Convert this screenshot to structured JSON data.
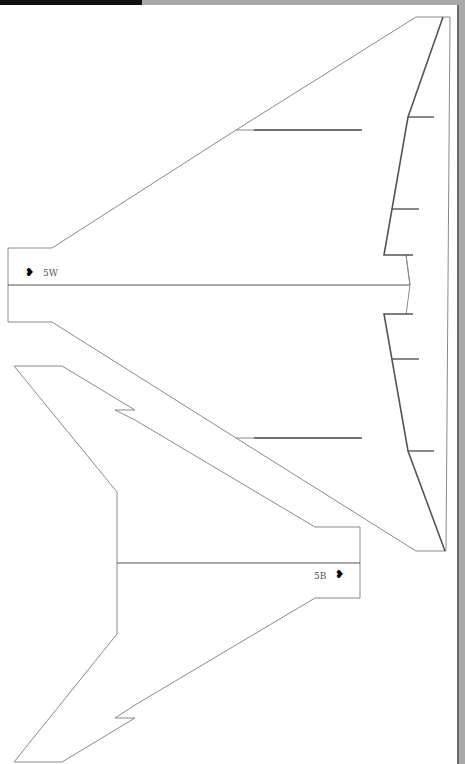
{
  "document": {
    "type": "paper airplane cut-out template",
    "stroke_color": "#888888",
    "fold_line_color": "#555555"
  },
  "parts": [
    {
      "id": "wing",
      "label": "5W",
      "marker": "bat-glyph",
      "orientation": "left"
    },
    {
      "id": "body",
      "label": "5B",
      "marker": "bat-glyph",
      "orientation": "right"
    }
  ],
  "labels": {
    "wing_code": "5W",
    "body_code": "5B",
    "wing_marker": "❥",
    "body_marker": "❥"
  }
}
